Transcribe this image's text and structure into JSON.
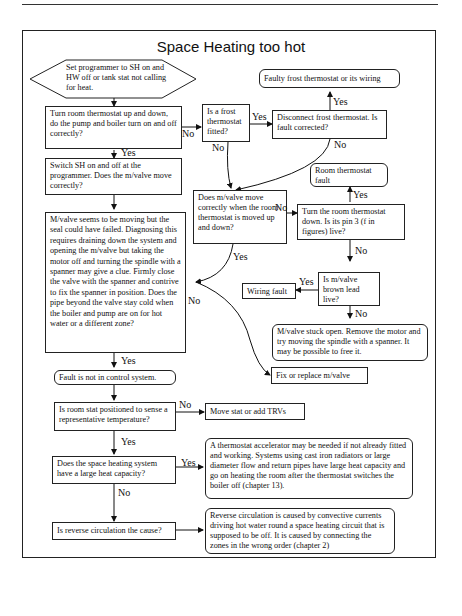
{
  "diagram": {
    "title": "Space Heating too hot",
    "nodes": {
      "start": "Set programmer to SH on and HW off or tank stat not calling for heat.",
      "turn_room_stat": "Turn room thermostat up and down, do the pump and boiler turn on and off correctly?",
      "frost_fitted": "Is a frost thermostat fitted?",
      "disconnect_frost": "Disconnect frost thermostat. Is fault corrected?",
      "faulty_frost": "Faulty frost thermostat or its wiring",
      "switch_sh": "Switch SH on and off at the programmer. Does the m/valve move correctly?",
      "mvalve_move_room": "Does m/valve move correctly when the room thermostat is moved up and down?",
      "room_stat_fault": "Room thermostat fault",
      "turn_room_down": "Turn the room thermostat down. Is its pin 3 (f in figures) live?",
      "seal_failed": "M/valve seems to be moving but the seal could have failed. Diagnosing this requires draining down the system and opening the m/valve but taking the motor off and turning the spindle with a spanner may give a clue. Firmly close the valve with the spanner and contrive to fix the spanner in position. Does the pipe beyond the valve stay cold when the boiler and pump are on for hot water or a different zone?",
      "brown_lead": "Is m/valve brown lead live?",
      "wiring_fault": "Wiring fault",
      "stuck_open": "M/valve stuck open. Remove the motor and try moving the spindle with a spanner. It may be possible to free it.",
      "fix_replace": "Fix or replace m/valve",
      "not_control": "Fault is not in control system.",
      "room_stat_position": "Is room stat positioned to sense a representative temperature?",
      "move_stat": "Move stat or add TRVs",
      "large_capacity": "Does the space heating system have a large heat capacity?",
      "accelerator": "A thermostat accelerator may be needed if not already fitted and working. Systems using cast iron radiators or large diameter flow and return pipes have large heat capacity and go on heating the room after the thermostat switches the boiler off (chapter 13).",
      "reverse_circ_q": "Is reverse circulation the cause?",
      "reverse_circ_info": "Reverse circulation is caused by convective currents driving hot water round a space heating circuit that is supposed to be off. It is caused by connecting the zones in the wrong order (chapter 2)"
    },
    "labels": {
      "yes": "Yes",
      "no": "No"
    }
  }
}
